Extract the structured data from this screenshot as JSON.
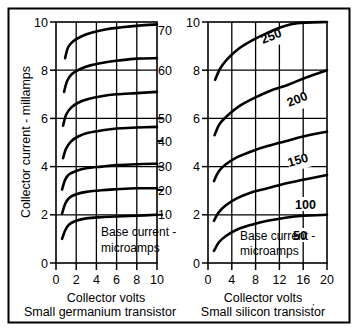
{
  "figure": {
    "background_color": "#ffffff",
    "ink_color": "#000000",
    "border": "outer rectangle frame"
  },
  "chart_data": [
    {
      "id": "germanium",
      "type": "line",
      "title": "Small germanium transistor",
      "xlabel": "Collector volts",
      "ylabel": "Collector current - millamps",
      "xlim": [
        0,
        10
      ],
      "ylim": [
        0,
        10
      ],
      "xticks": [
        0,
        2,
        4,
        6,
        8,
        10
      ],
      "yticks": [
        0,
        2,
        4,
        6,
        8,
        10
      ],
      "xticklabels": [
        "0",
        "2",
        "4",
        "6",
        "8",
        "10"
      ],
      "yticklabels": [
        "0",
        "2",
        "4",
        "6",
        "8",
        "10"
      ],
      "grid": true,
      "grid_x": [
        2,
        4,
        6,
        8
      ],
      "grid_y": [
        2,
        4,
        6,
        8
      ],
      "annotation": "Base current - microamps",
      "annotation_lines": [
        "Base current -",
        "microamps"
      ],
      "legend_position": "right-of-curve-ends",
      "series": [
        {
          "name": "10",
          "label": "10",
          "points": [
            [
              0.6,
              1.0
            ],
            [
              0.9,
              1.35
            ],
            [
              1.3,
              1.6
            ],
            [
              2.0,
              1.75
            ],
            [
              3.0,
              1.85
            ],
            [
              4.5,
              1.9
            ],
            [
              6.0,
              1.93
            ],
            [
              8.0,
              1.96
            ],
            [
              10.0,
              2.0
            ]
          ]
        },
        {
          "name": "20",
          "label": "20",
          "points": [
            [
              0.6,
              2.05
            ],
            [
              0.9,
              2.45
            ],
            [
              1.3,
              2.7
            ],
            [
              2.0,
              2.85
            ],
            [
              3.0,
              2.95
            ],
            [
              4.5,
              3.02
            ],
            [
              6.0,
              3.06
            ],
            [
              8.0,
              3.1
            ],
            [
              10.0,
              3.1
            ]
          ]
        },
        {
          "name": "30",
          "label": "30",
          "points": [
            [
              0.6,
              3.05
            ],
            [
              0.9,
              3.45
            ],
            [
              1.3,
              3.68
            ],
            [
              2.0,
              3.82
            ],
            [
              3.0,
              3.93
            ],
            [
              4.5,
              4.0
            ],
            [
              6.0,
              4.06
            ],
            [
              8.0,
              4.1
            ],
            [
              10.0,
              4.12
            ]
          ]
        },
        {
          "name": "40",
          "label": "40",
          "points": [
            [
              0.7,
              4.35
            ],
            [
              1.0,
              4.75
            ],
            [
              1.5,
              5.05
            ],
            [
              2.2,
              5.25
            ],
            [
              3.2,
              5.4
            ],
            [
              4.5,
              5.5
            ],
            [
              6.0,
              5.58
            ],
            [
              8.0,
              5.62
            ],
            [
              10.0,
              5.65
            ]
          ]
        },
        {
          "name": "50",
          "label": "50",
          "points": [
            [
              0.7,
              5.7
            ],
            [
              1.0,
              6.15
            ],
            [
              1.5,
              6.45
            ],
            [
              2.2,
              6.65
            ],
            [
              3.2,
              6.8
            ],
            [
              4.5,
              6.92
            ],
            [
              6.0,
              7.0
            ],
            [
              8.0,
              7.05
            ],
            [
              10.0,
              7.1
            ]
          ]
        },
        {
          "name": "60",
          "label": "60",
          "points": [
            [
              0.8,
              7.1
            ],
            [
              1.1,
              7.55
            ],
            [
              1.6,
              7.85
            ],
            [
              2.4,
              8.05
            ],
            [
              3.4,
              8.2
            ],
            [
              4.8,
              8.32
            ],
            [
              6.2,
              8.4
            ],
            [
              8.0,
              8.48
            ],
            [
              10.0,
              8.5
            ]
          ]
        },
        {
          "name": "70",
          "label": "70",
          "points": [
            [
              0.9,
              8.5
            ],
            [
              1.2,
              8.95
            ],
            [
              1.7,
              9.2
            ],
            [
              2.5,
              9.4
            ],
            [
              3.5,
              9.55
            ],
            [
              5.0,
              9.7
            ],
            [
              6.5,
              9.78
            ],
            [
              8.2,
              9.85
            ],
            [
              10.0,
              9.9
            ]
          ]
        }
      ]
    },
    {
      "id": "silicon",
      "type": "line",
      "title": "Small silicon transistor",
      "xlabel": "Collector volts",
      "ylabel": "Collector current - millamps",
      "xlim": [
        0,
        20
      ],
      "ylim": [
        0,
        10
      ],
      "xticks": [
        0,
        4,
        8,
        12,
        16,
        20
      ],
      "yticks": [
        0,
        2,
        4,
        6,
        8,
        10
      ],
      "xticklabels": [
        "0",
        "4",
        "8",
        "12",
        "16",
        "20"
      ],
      "yticklabels": [
        "0",
        "2",
        "4",
        "6",
        "8",
        "10"
      ],
      "grid": true,
      "grid_x": [
        4,
        8,
        12,
        16
      ],
      "grid_y": [
        2,
        4,
        6,
        8
      ],
      "annotation": "Base current - microamps",
      "annotation_lines": [
        "Base current -",
        "microamps"
      ],
      "legend_position": "on-curve",
      "series": [
        {
          "name": "50",
          "label": "50",
          "points": [
            [
              1.0,
              0.5
            ],
            [
              1.8,
              0.85
            ],
            [
              3.0,
              1.12
            ],
            [
              5.0,
              1.4
            ],
            [
              7.5,
              1.6
            ],
            [
              10.0,
              1.75
            ],
            [
              13.0,
              1.88
            ],
            [
              16.0,
              1.96
            ],
            [
              20.0,
              2.0
            ]
          ]
        },
        {
          "name": "100",
          "label": "100",
          "points": [
            [
              1.0,
              1.75
            ],
            [
              1.8,
              2.1
            ],
            [
              3.0,
              2.4
            ],
            [
              5.0,
              2.7
            ],
            [
              7.5,
              2.95
            ],
            [
              10.0,
              3.1
            ],
            [
              13.0,
              3.3
            ],
            [
              16.0,
              3.45
            ],
            [
              20.0,
              3.65
            ]
          ]
        },
        {
          "name": "150",
          "label": "150",
          "points": [
            [
              1.0,
              3.4
            ],
            [
              1.8,
              3.8
            ],
            [
              3.0,
              4.1
            ],
            [
              5.0,
              4.4
            ],
            [
              7.5,
              4.65
            ],
            [
              10.0,
              4.85
            ],
            [
              13.0,
              5.05
            ],
            [
              16.0,
              5.25
            ],
            [
              20.0,
              5.45
            ]
          ]
        },
        {
          "name": "200",
          "label": "200",
          "points": [
            [
              1.1,
              5.3
            ],
            [
              1.9,
              5.75
            ],
            [
              3.2,
              6.1
            ],
            [
              5.2,
              6.5
            ],
            [
              7.8,
              6.85
            ],
            [
              10.5,
              7.15
            ],
            [
              13.5,
              7.4
            ],
            [
              16.5,
              7.7
            ],
            [
              20.0,
              8.0
            ]
          ]
        },
        {
          "name": "250",
          "label": "250",
          "points": [
            [
              1.2,
              7.6
            ],
            [
              2.0,
              8.05
            ],
            [
              3.2,
              8.45
            ],
            [
              5.2,
              8.9
            ],
            [
              7.5,
              9.25
            ],
            [
              10.0,
              9.55
            ],
            [
              12.5,
              9.8
            ],
            [
              15.0,
              9.95
            ],
            [
              20.0,
              10.0
            ]
          ]
        }
      ]
    }
  ]
}
